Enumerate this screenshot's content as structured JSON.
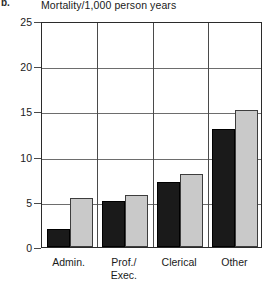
{
  "figure": {
    "label": "b.",
    "title": "Mortality/1,000 person years"
  },
  "chart_data": {
    "type": "bar",
    "title": "Mortality/1,000 person years",
    "xlabel": "",
    "ylabel": "Mortality/1,000 person years",
    "ylim": [
      0,
      25
    ],
    "yticks": [
      0,
      5,
      10,
      15,
      20,
      25
    ],
    "ytick_labels": [
      "0",
      "5",
      "10",
      "15",
      "20",
      "25"
    ],
    "grid": true,
    "legend": "none",
    "categories": [
      "Admin.",
      "Prof./\nExec.",
      "Clerical",
      "Other"
    ],
    "series": [
      {
        "name": "series-dark",
        "color": "#1a1a1a",
        "values": [
          2.0,
          5.1,
          7.2,
          13.0
        ]
      },
      {
        "name": "series-light",
        "color": "#c9c9c9",
        "values": [
          5.4,
          5.8,
          8.1,
          15.2
        ]
      }
    ]
  }
}
